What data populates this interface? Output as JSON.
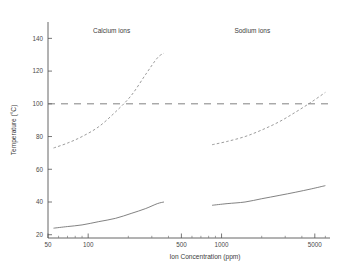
{
  "chart_data": {
    "type": "line",
    "title": "",
    "xlabel": "Ion Concentration (ppm)",
    "ylabel": "Temperature (°C)",
    "xscale": "log",
    "xlim": [
      50,
      6500
    ],
    "ylim": [
      18,
      150
    ],
    "grid": false,
    "legend_position": "inline-annotations",
    "xticks": [
      50,
      100,
      500,
      1000,
      5000
    ],
    "xticklabels": [
      "50",
      "100",
      "500",
      "1000",
      "5000"
    ],
    "yticks": [
      20,
      40,
      60,
      80,
      100,
      120,
      140
    ],
    "yticklabels": [
      "20",
      "40",
      "60",
      "80",
      "100",
      "120",
      "140"
    ],
    "annotations": [
      {
        "text": "Calcium ions",
        "x": 150,
        "y": 143
      },
      {
        "text": "Sodium ions",
        "x": 1700,
        "y": 143
      }
    ],
    "reference_lines": [
      {
        "y": 100,
        "style": "long-dashed",
        "label": ""
      }
    ],
    "series": [
      {
        "name": "Calcium ions — boiling point rise",
        "group": "Calcium ions",
        "style": "dashed",
        "x": [
          55,
          70,
          90,
          120,
          160,
          210,
          270,
          330,
          370
        ],
        "y": [
          73,
          76,
          80,
          86,
          95,
          105,
          118,
          128,
          131
        ]
      },
      {
        "name": "Calcium ions — lower curve",
        "group": "Calcium ions",
        "style": "solid",
        "x": [
          55,
          70,
          90,
          120,
          160,
          210,
          270,
          330,
          370
        ],
        "y": [
          24,
          25,
          26,
          28,
          30,
          33,
          36,
          39,
          40
        ]
      },
      {
        "name": "Sodium ions — boiling point rise",
        "group": "Sodium ions",
        "style": "dashed",
        "x": [
          850,
          1100,
          1500,
          2000,
          2700,
          3600,
          4700,
          6000
        ],
        "y": [
          75,
          77,
          80,
          84,
          89,
          95,
          101,
          107
        ]
      },
      {
        "name": "Sodium ions — lower curve",
        "group": "Sodium ions",
        "style": "solid",
        "x": [
          850,
          1100,
          1500,
          2000,
          2700,
          3600,
          4700,
          6000
        ],
        "y": [
          38,
          39,
          40,
          42,
          44,
          46,
          48,
          50
        ]
      }
    ]
  }
}
